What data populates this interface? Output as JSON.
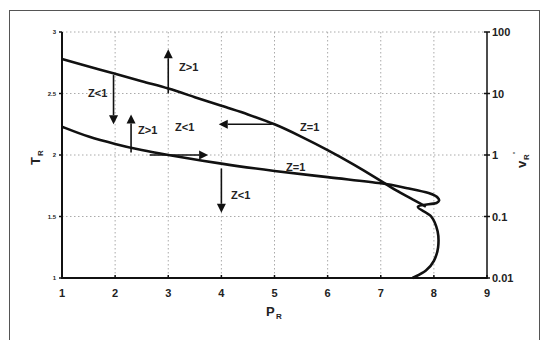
{
  "chart_data": {
    "type": "line",
    "title": "",
    "xlabel": "P_R",
    "xlabel_main": "P",
    "xlabel_sub": "R",
    "ylabel": "T_R",
    "ylabel_main": "T",
    "ylabel_sub": "R",
    "y2label": "v_R'",
    "y2label_main": "v",
    "y2label_sub": "R",
    "y2label_sup": "'",
    "xlim": [
      1,
      9
    ],
    "ylim": [
      1,
      3
    ],
    "y2lim": [
      0.01,
      100
    ],
    "y2scale": "log",
    "grid": true,
    "x_ticks": [
      "1",
      "2",
      "3",
      "4",
      "5",
      "6",
      "7",
      "8",
      "9"
    ],
    "y_ticks": [
      "1",
      "1.5",
      "2",
      "2.5",
      "3"
    ],
    "y2_ticks": [
      "0.01",
      "0.1",
      "1",
      "10",
      "100"
    ],
    "series": [
      {
        "name": "Z=1 (upper curve)",
        "x": [
          1.0,
          1.5,
          2.0,
          2.5,
          3.0,
          3.5,
          4.0,
          4.5,
          5.0,
          5.5,
          6.0,
          6.5,
          7.0,
          7.3,
          7.6,
          7.85
        ],
        "y": [
          2.78,
          2.72,
          2.66,
          2.6,
          2.54,
          2.47,
          2.4,
          2.33,
          2.25,
          2.15,
          2.04,
          1.92,
          1.79,
          1.71,
          1.64,
          1.58
        ]
      },
      {
        "name": "Z=1 (lower curve)",
        "x": [
          1.0,
          1.5,
          2.0,
          2.5,
          3.0,
          4.0,
          5.0,
          6.0,
          7.0,
          7.5,
          7.9,
          8.08,
          8.05,
          7.7,
          7.95,
          8.07,
          8.08,
          8.0,
          7.85,
          7.6
        ],
        "y": [
          2.23,
          2.15,
          2.09,
          2.04,
          2.0,
          1.93,
          1.87,
          1.82,
          1.77,
          1.73,
          1.69,
          1.65,
          1.61,
          1.58,
          1.5,
          1.38,
          1.25,
          1.14,
          1.06,
          1.0
        ]
      }
    ],
    "annotations": [
      {
        "text": "Z>1",
        "x": 3.2,
        "y": 2.72
      },
      {
        "text": "Z<1",
        "x": 1.5,
        "y": 2.57
      },
      {
        "text": "Z>1",
        "x": 2.45,
        "y": 2.05
      },
      {
        "text": "Z<1",
        "x": 3.2,
        "y": 2.25
      },
      {
        "text": "Z=1",
        "x": 5.6,
        "y": 2.25
      },
      {
        "text": "Z=1",
        "x": 5.4,
        "y": 1.9
      },
      {
        "text": "Z<1",
        "x": 4.15,
        "y": 1.7
      }
    ],
    "arrows": [
      {
        "from": [
          3.0,
          2.5
        ],
        "to": [
          3.0,
          2.86
        ],
        "direction": "up"
      },
      {
        "from": [
          1.97,
          2.65
        ],
        "to": [
          1.97,
          2.25
        ],
        "direction": "down"
      },
      {
        "from": [
          2.3,
          2.02
        ],
        "to": [
          2.3,
          2.33
        ],
        "direction": "up"
      },
      {
        "from": [
          2.65,
          2.0
        ],
        "to": [
          3.75,
          2.0
        ],
        "direction": "right"
      },
      {
        "from": [
          4.95,
          2.25
        ],
        "to": [
          3.95,
          2.25
        ],
        "direction": "left"
      },
      {
        "from": [
          4.0,
          1.89
        ],
        "to": [
          4.0,
          1.53
        ],
        "direction": "down"
      }
    ]
  },
  "labels": {
    "annotation_0": "Z>1",
    "annotation_1": "Z<1",
    "annotation_2": "Z>1",
    "annotation_3": "Z<1",
    "annotation_4": "Z=1",
    "annotation_5": "Z=1",
    "annotation_6": "Z<1"
  }
}
